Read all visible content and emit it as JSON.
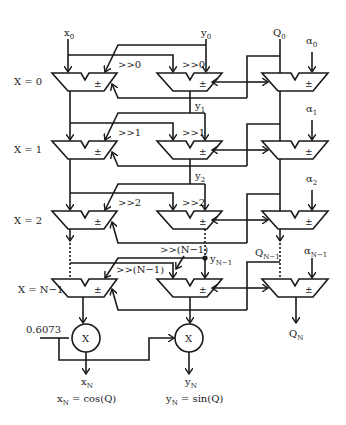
{
  "diagram": {
    "inputs": {
      "x0": {
        "base": "x",
        "sub": "0"
      },
      "y0": {
        "base": "y",
        "sub": "0"
      },
      "q0": {
        "base": "Q",
        "sub": "0"
      }
    },
    "stages": [
      {
        "label": "X = 0",
        "shift": ">>0",
        "alpha": {
          "base": "α",
          "sub": "0"
        },
        "y_tap": {
          "base": "y",
          "sub": "1"
        }
      },
      {
        "label": "X = 1",
        "shift": ">>1",
        "alpha": {
          "base": "α",
          "sub": "1"
        },
        "y_tap": {
          "base": "y",
          "sub": "2"
        }
      },
      {
        "label": "X = 2",
        "shift": ">>2",
        "alpha": {
          "base": "α",
          "sub": "2"
        }
      },
      {
        "label": "X = N−1",
        "shift": ">>(N−1)",
        "alpha": {
          "base": "α",
          "sub": "N−1"
        },
        "y_tap": {
          "base": "y",
          "sub": "N−1"
        },
        "q_tap": {
          "base": "Q",
          "sub": "N−1"
        }
      }
    ],
    "adder_symbol": "±",
    "multiplier_symbol": "X",
    "constant": "0.6073",
    "outputs": {
      "xn": {
        "base": "x",
        "sub": "N"
      },
      "yn": {
        "base": "y",
        "sub": "N"
      },
      "qn": {
        "base": "Q",
        "sub": "N"
      },
      "xn_eq": {
        "base": "x",
        "sub": "N",
        "rest": " = cos(Q)"
      },
      "yn_eq": {
        "base": "y",
        "sub": "N",
        "rest": " = sin(Q)"
      }
    },
    "colors": {
      "line": "#1a1a1a",
      "background": "#ffffff"
    }
  }
}
